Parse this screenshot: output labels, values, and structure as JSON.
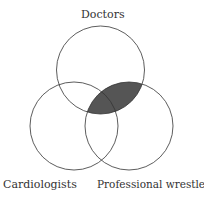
{
  "diagram": {
    "type": "venn",
    "sets": [
      {
        "label": "Doctors",
        "cx": 100.5,
        "cy": 70,
        "r": 44
      },
      {
        "label": "Cardiologists",
        "cx": 74,
        "cy": 126,
        "r": 44
      },
      {
        "label": "Professional wrestlers",
        "cx": 129,
        "cy": 126,
        "r": 44
      }
    ],
    "shaded_region": "Doctors ∩ Professional wrestlers",
    "shade_color": "#555555",
    "stroke_color": "#333333"
  }
}
